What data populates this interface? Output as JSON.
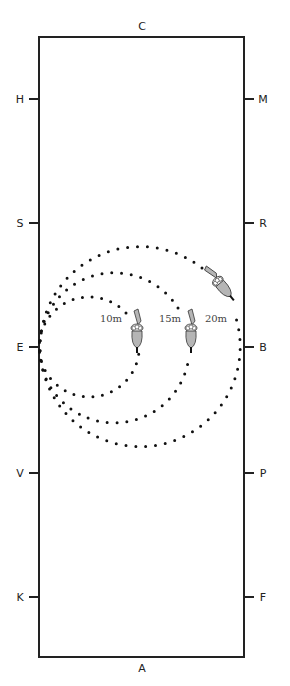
{
  "diagram": {
    "type": "dressage-arena",
    "arena": {
      "x": 39,
      "y": 37,
      "width": 205,
      "height": 620,
      "stroke": "#222222"
    },
    "markers": [
      {
        "letter": "C",
        "side": "top",
        "x": 142,
        "y": 30
      },
      {
        "letter": "H",
        "side": "left",
        "x": 20,
        "y": 99
      },
      {
        "letter": "M",
        "side": "right",
        "x": 263,
        "y": 99
      },
      {
        "letter": "S",
        "side": "left",
        "x": 20,
        "y": 223
      },
      {
        "letter": "R",
        "side": "right",
        "x": 263,
        "y": 223
      },
      {
        "letter": "E",
        "side": "left",
        "x": 20,
        "y": 347
      },
      {
        "letter": "B",
        "side": "right",
        "x": 263,
        "y": 347
      },
      {
        "letter": "V",
        "side": "left",
        "x": 20,
        "y": 473
      },
      {
        "letter": "P",
        "side": "right",
        "x": 263,
        "y": 473
      },
      {
        "letter": "K",
        "side": "left",
        "x": 20,
        "y": 597
      },
      {
        "letter": "F",
        "side": "right",
        "x": 263,
        "y": 597
      },
      {
        "letter": "A",
        "side": "bottom",
        "x": 142,
        "y": 672
      }
    ],
    "circles": [
      {
        "label": "10m",
        "cx": 89,
        "cy": 347,
        "r": 50,
        "label_x": 111,
        "label_y": 322
      },
      {
        "label": "15m",
        "cx": 114,
        "cy": 347,
        "r": 75,
        "label_x": 170,
        "label_y": 322
      },
      {
        "label": "20m",
        "cx": 140,
        "cy": 347,
        "r": 100,
        "label_x": 216,
        "label_y": 322
      }
    ],
    "horses": [
      {
        "name": "horse-10m",
        "x": 137,
        "y": 330,
        "angle": 0
      },
      {
        "name": "horse-15m",
        "x": 190,
        "y": 330,
        "angle": 0
      },
      {
        "name": "horse-20m",
        "x": 218,
        "y": 278,
        "angle": -40
      }
    ],
    "colors": {
      "line": "#222222",
      "dot": "#111111",
      "horse_fill": "#b5b5b5",
      "horse_stroke": "#333333"
    }
  }
}
